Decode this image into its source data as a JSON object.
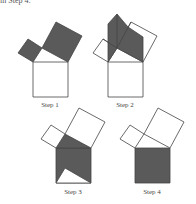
{
  "header": {
    "text": "in Step 4."
  },
  "figures": [
    {
      "label": "Step 1"
    },
    {
      "label": "Step 2"
    },
    {
      "label": "Step 3"
    },
    {
      "label": "Step 4"
    }
  ],
  "colors": {
    "shade": "#5a5a5a",
    "stroke": "#444444"
  }
}
